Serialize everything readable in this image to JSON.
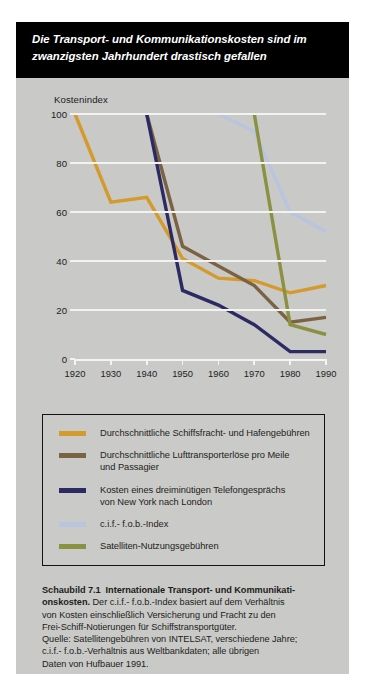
{
  "title": {
    "line1": "Die Transport- und Kommunikationskosten sind im",
    "line2": "zwanzigsten Jahrhundert drastisch gefallen"
  },
  "chart_data": {
    "type": "line",
    "title": "Die Transport- und Kommunikationskosten sind im zwanzigsten Jahrhundert drastisch gefallen",
    "xlabel": "",
    "ylabel": "Kostenindex",
    "x": [
      1920,
      1930,
      1940,
      1950,
      1960,
      1970,
      1980,
      1990
    ],
    "xlim": [
      1920,
      1990
    ],
    "ylim": [
      0,
      100
    ],
    "yticks": [
      0,
      20,
      40,
      60,
      80,
      100
    ],
    "xticks": [
      1920,
      1930,
      1940,
      1950,
      1960,
      1970,
      1980,
      1990
    ],
    "grid": true,
    "legend_position": "below-plot",
    "series": [
      {
        "name": "Durchschnittliche Schiffsfracht- und Hafengebühren",
        "color": "#d49a2b",
        "x": [
          1920,
          1930,
          1940,
          1950,
          1960,
          1970,
          1980,
          1990
        ],
        "values": [
          100,
          64,
          66,
          41,
          33,
          32,
          27,
          30
        ]
      },
      {
        "name": "Durchschnittliche Lufttransporterlöse pro Meile und Passagier",
        "color": "#7a6242",
        "x": [
          1940,
          1950,
          1960,
          1970,
          1980,
          1990
        ],
        "values": [
          100,
          46,
          38,
          30,
          15,
          17
        ]
      },
      {
        "name": "Kosten eines dreiminütigen Telefongesprächs von New York nach London",
        "color": "#2b2a63",
        "x": [
          1940,
          1950,
          1960,
          1970,
          1980,
          1990
        ],
        "values": [
          100,
          28,
          22,
          14,
          3,
          3
        ]
      },
      {
        "name": "c.i.f.- f.o.b.-Index",
        "color": "#b9c4de",
        "x": [
          1960,
          1970,
          1980,
          1990
        ],
        "values": [
          100,
          93,
          60,
          52
        ]
      },
      {
        "name": "Satelliten-Nutzungsgebühren",
        "color": "#8a9141",
        "x": [
          1970,
          1980,
          1990
        ],
        "values": [
          100,
          14,
          10
        ]
      }
    ]
  },
  "axis": {
    "y_title": "Kostenindex",
    "y_labels": [
      "0",
      "20",
      "40",
      "60",
      "80",
      "100"
    ],
    "x_labels": [
      "1920",
      "1930",
      "1940",
      "1950",
      "1960",
      "1970",
      "1980",
      "1990"
    ]
  },
  "legend": {
    "items": [
      {
        "color": "#d49a2b",
        "line1": "Durchschnittliche Schiffsfracht- und Hafengebühren",
        "line2": ""
      },
      {
        "color": "#7a6242",
        "line1": "Durchschnittliche Lufttransporterlöse pro Meile",
        "line2": "und Passagier"
      },
      {
        "color": "#2b2a63",
        "line1": "Kosten eines dreiminütigen Telefongesprächs",
        "line2": "von New York nach London"
      },
      {
        "color": "#b9c4de",
        "line1": "c.i.f.- f.o.b.-Index",
        "line2": ""
      },
      {
        "color": "#8a9141",
        "line1": "Satelliten-Nutzungsgebühren",
        "line2": ""
      }
    ]
  },
  "caption": {
    "label": "Schaubild 7.1",
    "heading": "Internationale Transport- und Kommunikati-",
    "heading2": "onskosten.",
    "body1": " Der c.i.f.- f.o.b.-Index basiert auf dem Verhältnis",
    "body2": "von Kosten einschließlich Versicherung und Fracht zu den",
    "body3": "Frei-Schiff-Notierungen für Schiffstransportgüter.",
    "src1": "Quelle: Satellitengebühren von INTELSAT, verschiedene Jahre;",
    "src2": "c.i.f.- f.o.b.-Verhältnis aus Weltbankdaten; alle übrigen",
    "src3": "Daten von Hufbauer 1991."
  }
}
